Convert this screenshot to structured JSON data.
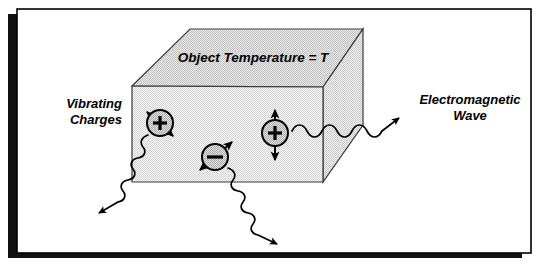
{
  "figure": {
    "title_label": "Object Temperature = T",
    "left_label_line1": "Vibrating",
    "left_label_line2": "Charges",
    "right_label_line1": "Electromagnetic",
    "right_label_line2": "Wave",
    "charge_positive_symbol": "+",
    "charge_negative_symbol": "−",
    "colors": {
      "frame_border": "#000000",
      "frame_shadow": "#111111",
      "page_background": "#ffffff",
      "box_front_fill": "#e9e9e9",
      "box_top_fill": "#d8d8d8",
      "box_side_fill": "#dedede",
      "box_outline": "#3a3a3a",
      "charge_fill": "#c9c9c9",
      "charge_outline": "#000000",
      "wave_stroke": "#000000",
      "arrow_fill": "#000000",
      "text": "#000000"
    },
    "charges": [
      {
        "name": "positive-charge-left",
        "sign": "+",
        "cx": 160,
        "cy": 123,
        "r": 13
      },
      {
        "name": "negative-charge-center",
        "sign": "−",
        "cx": 215,
        "cy": 157,
        "r": 13
      },
      {
        "name": "positive-charge-right",
        "sign": "+",
        "cx": 275,
        "cy": 133,
        "r": 13
      }
    ],
    "waves": [
      {
        "name": "wave-down-left",
        "direction": "down-left"
      },
      {
        "name": "wave-down-right",
        "direction": "down-right"
      },
      {
        "name": "wave-right",
        "direction": "right"
      }
    ]
  }
}
